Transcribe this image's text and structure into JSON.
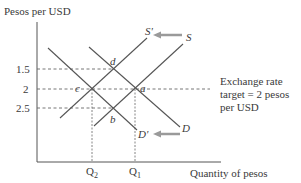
{
  "diagram": {
    "type": "supply-demand",
    "y_axis_label": "Pesos per USD",
    "x_axis_label": "Quantity of pesos",
    "y_ticks": [
      {
        "label": "1.5",
        "y": 69
      },
      {
        "label": "2",
        "y": 89
      },
      {
        "label": "2.5",
        "y": 108
      }
    ],
    "x_ticks": [
      {
        "label": "Q",
        "sub": "2",
        "x": 92
      },
      {
        "label": "Q",
        "sub": "1",
        "x": 135
      }
    ],
    "curves": {
      "S": "S",
      "S_prime": "S'",
      "D": "D",
      "D_prime": "D'"
    },
    "points": {
      "a": "a",
      "b": "b",
      "c": "c",
      "d": "d"
    },
    "annotation": {
      "line1": "Exchange rate",
      "line2": "target = 2 pesos",
      "line3": "per USD"
    },
    "colors": {
      "line": "#555555",
      "arrow": "#9a9a9a",
      "dash": "#666666",
      "text": "#3a3a3a"
    }
  }
}
